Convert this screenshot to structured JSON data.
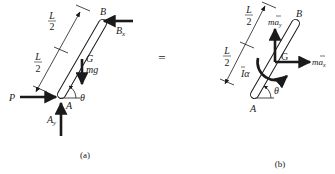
{
  "figure": {
    "equals_sign": "=",
    "colors": {
      "ink": "#1a1a1a",
      "rod_fill": "#ffffff",
      "background": "#ffffff"
    },
    "panel_a": {
      "caption": "(a)",
      "labels": {
        "B": "B",
        "Bx": "B",
        "Bx_sub": "x",
        "G": "G",
        "mg": "mg",
        "P": "P",
        "A": "A",
        "Ay": "A",
        "Ay_sub": "y",
        "theta": "θ",
        "L_top": "L",
        "two_top": "2",
        "L_bot": "L",
        "two_bot": "2"
      },
      "forces": [
        "P",
        "A_y",
        "B_x",
        "mg"
      ]
    },
    "panel_b": {
      "caption": "(b)",
      "labels": {
        "B": "B",
        "G": "G",
        "A": "A",
        "theta": "θ",
        "may": "ma",
        "may_sub": "y",
        "max": "ma",
        "max_sub": "x",
        "Ialpha": "Iα",
        "L_top": "L",
        "two_top": "2",
        "L_bot": "L",
        "two_bot": "2"
      },
      "effective_forces": [
        "m a_y",
        "m a_x",
        "I α"
      ]
    }
  }
}
